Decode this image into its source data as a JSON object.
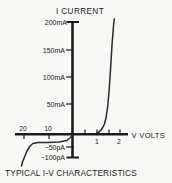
{
  "figure": {
    "title": "I CURRENT",
    "x_axis_label": "V VOLTS",
    "caption": "TYPICAL I-V CHARACTERISTICS"
  },
  "axis_labels": {
    "y_pos": [
      {
        "label": "200mA"
      },
      {
        "label": "150mA"
      },
      {
        "label": "100mA"
      },
      {
        "label": "50mA"
      }
    ],
    "y_neg": [
      {
        "label": "−50pA"
      },
      {
        "label": "−100pA"
      }
    ],
    "x_pos": [
      {
        "label": "1"
      },
      {
        "label": "2"
      }
    ],
    "x_neg": [
      {
        "label": "20"
      },
      {
        "label": "10"
      }
    ]
  },
  "chart_data": {
    "type": "line",
    "title": "TYPICAL I-V CHARACTERISTICS",
    "xlabel": "V VOLTS",
    "ylabel": "I CURRENT",
    "x_units": "V",
    "y_units_forward": "mA",
    "y_units_reverse": "pA",
    "broken_scale": true,
    "grid": false,
    "legend": "none",
    "x_ticks_forward_volts": [
      0.5,
      1,
      1.5,
      2
    ],
    "x_tick_labels_forward": [
      "1",
      "2"
    ],
    "x_ticks_reverse_volts": [
      -20,
      -10
    ],
    "y_ticks_forward_mA": [
      50,
      100,
      150,
      200
    ],
    "y_ticks_reverse_pA": [
      -50,
      -100
    ],
    "series": [
      {
        "name": "forward-bias",
        "x_volts": [
          0,
          1.0,
          1.15,
          1.3,
          1.4,
          1.45,
          1.5,
          1.55,
          1.6,
          1.65
        ],
        "y_mA": [
          0,
          0,
          5,
          25,
          60,
          90,
          125,
          160,
          190,
          210
        ]
      },
      {
        "name": "reverse-bias",
        "x_volts": [
          0,
          -5,
          -10,
          -15,
          -18,
          -19,
          -20,
          -20.5,
          -21
        ],
        "y_pA": [
          0,
          -22,
          -24,
          -26,
          -35,
          -55,
          -95,
          -140,
          -190
        ]
      }
    ]
  },
  "render": {
    "colors": {
      "ink": "#1b1b1b",
      "background": "#f7f7f5"
    },
    "forward_curve_px": [
      [
        97,
        133
      ],
      [
        99,
        132
      ],
      [
        101,
        130
      ],
      [
        103,
        127
      ],
      [
        104.5,
        124
      ],
      [
        106,
        118
      ],
      [
        107.5,
        108
      ],
      [
        109,
        92
      ],
      [
        110.5,
        70
      ],
      [
        112,
        45
      ],
      [
        113.5,
        26
      ],
      [
        114.3,
        19
      ]
    ],
    "reverse_curve_px": [
      [
        72.5,
        135.5
      ],
      [
        67,
        140.5
      ],
      [
        59,
        142
      ],
      [
        48,
        142.5
      ],
      [
        38,
        142.5
      ],
      [
        33,
        143.5
      ],
      [
        30,
        146
      ],
      [
        27,
        151
      ],
      [
        24.5,
        157
      ],
      [
        22.5,
        162
      ],
      [
        21.5,
        166
      ]
    ]
  }
}
